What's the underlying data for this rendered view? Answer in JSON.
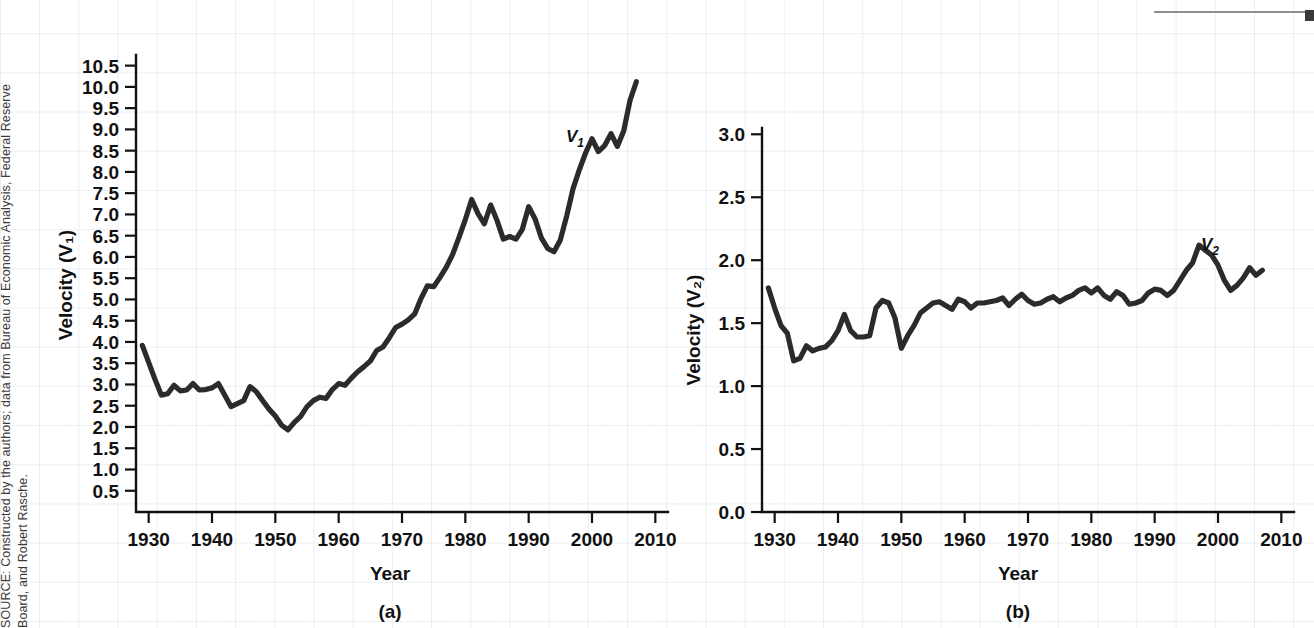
{
  "source_note": {
    "line1": "SOURCE: Constructed by the authors; data from Bureau of Economic Analysis, Federal Reserve",
    "line2": "Board, and Robert Rasche."
  },
  "chart_data": [
    {
      "id": "panel-a",
      "type": "line",
      "title": "",
      "panel_label": "(a)",
      "xlabel": "Year",
      "ylabel": "Velocity (V₁)",
      "series_label": "V",
      "series_label_sub": "1",
      "xlim": [
        1928,
        2012
      ],
      "ylim": [
        0.0,
        10.75
      ],
      "xticks": [
        1930,
        1940,
        1950,
        1960,
        1970,
        1980,
        1990,
        2000,
        2010
      ],
      "xticklabels": [
        "1930",
        "1940",
        "1950",
        "1960",
        "1970",
        "1980",
        "1990",
        "2000",
        "2010"
      ],
      "yticks": [
        0.5,
        1.0,
        1.5,
        2.0,
        2.5,
        3.0,
        3.5,
        4.0,
        4.5,
        5.0,
        5.5,
        6.0,
        6.5,
        7.0,
        7.5,
        8.0,
        8.5,
        9.0,
        9.5,
        10.0,
        10.5
      ],
      "yticklabels": [
        "0.5",
        "1.0",
        "1.5",
        "2.0",
        "2.5",
        "3.0",
        "3.5",
        "4.0",
        "4.5",
        "5.0",
        "5.5",
        "6.0",
        "6.5",
        "7.0",
        "7.5",
        "8.0",
        "8.5",
        "9.0",
        "9.5",
        "10.0",
        "10.5"
      ],
      "grid": false,
      "legend": "inline-label",
      "x": [
        1929,
        1930,
        1931,
        1932,
        1933,
        1934,
        1935,
        1936,
        1937,
        1938,
        1939,
        1940,
        1941,
        1942,
        1943,
        1944,
        1945,
        1946,
        1947,
        1948,
        1949,
        1950,
        1951,
        1952,
        1953,
        1954,
        1955,
        1956,
        1957,
        1958,
        1959,
        1960,
        1961,
        1962,
        1963,
        1964,
        1965,
        1966,
        1967,
        1968,
        1969,
        1970,
        1971,
        1972,
        1973,
        1974,
        1975,
        1976,
        1977,
        1978,
        1979,
        1980,
        1981,
        1982,
        1983,
        1984,
        1985,
        1986,
        1987,
        1988,
        1989,
        1990,
        1991,
        1992,
        1993,
        1994,
        1995,
        1996,
        1997,
        1998,
        1999,
        2000,
        2001,
        2002,
        2003,
        2004,
        2005,
        2006,
        2007
      ],
      "y": [
        3.92,
        3.52,
        3.12,
        2.75,
        2.78,
        2.98,
        2.85,
        2.87,
        3.02,
        2.87,
        2.88,
        2.92,
        3.02,
        2.75,
        2.48,
        2.55,
        2.62,
        2.95,
        2.83,
        2.62,
        2.42,
        2.26,
        2.04,
        1.93,
        2.11,
        2.25,
        2.48,
        2.62,
        2.7,
        2.67,
        2.88,
        3.02,
        2.98,
        3.15,
        3.3,
        3.42,
        3.55,
        3.8,
        3.88,
        4.1,
        4.34,
        4.42,
        4.52,
        4.66,
        5.02,
        5.32,
        5.3,
        5.52,
        5.76,
        6.06,
        6.46,
        6.88,
        7.35,
        7.02,
        6.78,
        7.22,
        6.86,
        6.42,
        6.48,
        6.42,
        6.65,
        7.18,
        6.9,
        6.45,
        6.2,
        6.12,
        6.4,
        6.96,
        7.6,
        8.05,
        8.45,
        8.78,
        8.48,
        8.62,
        8.9,
        8.6,
        8.96,
        9.68,
        10.12
      ]
    },
    {
      "id": "panel-b",
      "type": "line",
      "title": "",
      "panel_label": "(b)",
      "xlabel": "Year",
      "ylabel": "Velocity (V₂)",
      "series_label": "V",
      "series_label_sub": "2",
      "xlim": [
        1928,
        2012
      ],
      "ylim": [
        0.0,
        3.05
      ],
      "xticks": [
        1930,
        1940,
        1950,
        1960,
        1970,
        1980,
        1990,
        2000,
        2010
      ],
      "xticklabels": [
        "1930",
        "1940",
        "1950",
        "1960",
        "1970",
        "1980",
        "1990",
        "2000",
        "2010"
      ],
      "yticks": [
        0.0,
        0.5,
        1.0,
        1.5,
        2.0,
        2.5,
        3.0
      ],
      "yticklabels": [
        "0.0",
        "0.5",
        "1.0",
        "1.5",
        "2.0",
        "2.5",
        "3.0"
      ],
      "grid": false,
      "legend": "inline-label",
      "x": [
        1929,
        1930,
        1931,
        1932,
        1933,
        1934,
        1935,
        1936,
        1937,
        1938,
        1939,
        1940,
        1941,
        1942,
        1943,
        1944,
        1945,
        1946,
        1947,
        1948,
        1949,
        1950,
        1951,
        1952,
        1953,
        1954,
        1955,
        1956,
        1957,
        1958,
        1959,
        1960,
        1961,
        1962,
        1963,
        1964,
        1965,
        1966,
        1967,
        1968,
        1969,
        1970,
        1971,
        1972,
        1973,
        1974,
        1975,
        1976,
        1977,
        1978,
        1979,
        1980,
        1981,
        1982,
        1983,
        1984,
        1985,
        1986,
        1987,
        1988,
        1989,
        1990,
        1991,
        1992,
        1993,
        1994,
        1995,
        1996,
        1997,
        1998,
        1999,
        2000,
        2001,
        2002,
        2003,
        2004,
        2005,
        2006,
        2007
      ],
      "y": [
        1.78,
        1.62,
        1.48,
        1.42,
        1.2,
        1.22,
        1.32,
        1.28,
        1.3,
        1.31,
        1.36,
        1.44,
        1.57,
        1.44,
        1.39,
        1.39,
        1.4,
        1.62,
        1.68,
        1.66,
        1.54,
        1.3,
        1.4,
        1.48,
        1.58,
        1.62,
        1.66,
        1.67,
        1.64,
        1.61,
        1.69,
        1.67,
        1.62,
        1.66,
        1.66,
        1.67,
        1.68,
        1.7,
        1.64,
        1.69,
        1.73,
        1.68,
        1.65,
        1.66,
        1.69,
        1.71,
        1.67,
        1.7,
        1.72,
        1.76,
        1.78,
        1.74,
        1.78,
        1.72,
        1.69,
        1.75,
        1.72,
        1.65,
        1.66,
        1.68,
        1.74,
        1.77,
        1.76,
        1.72,
        1.76,
        1.84,
        1.92,
        1.98,
        2.12,
        2.08,
        2.04,
        1.96,
        1.84,
        1.76,
        1.8,
        1.86,
        1.94,
        1.88,
        1.92
      ]
    }
  ]
}
